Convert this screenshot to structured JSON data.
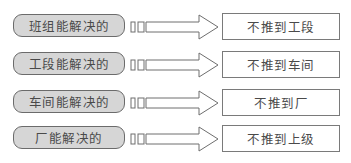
{
  "diagram": {
    "colors": {
      "pill_fill": "#d6d6d6",
      "pill_border": "#6b6b6b",
      "box_border": "#7a7a7a",
      "arrow_stroke": "#6e6e6e",
      "text": "#4a4a4a"
    },
    "rows": [
      {
        "source": "班组能解决的",
        "target": "不推到工段"
      },
      {
        "source": "工段能解决的",
        "target": "不推到车间"
      },
      {
        "source": "车间能解决的",
        "target": "不推到厂"
      },
      {
        "source": "厂能解决的",
        "target": "不推到上级"
      }
    ]
  }
}
